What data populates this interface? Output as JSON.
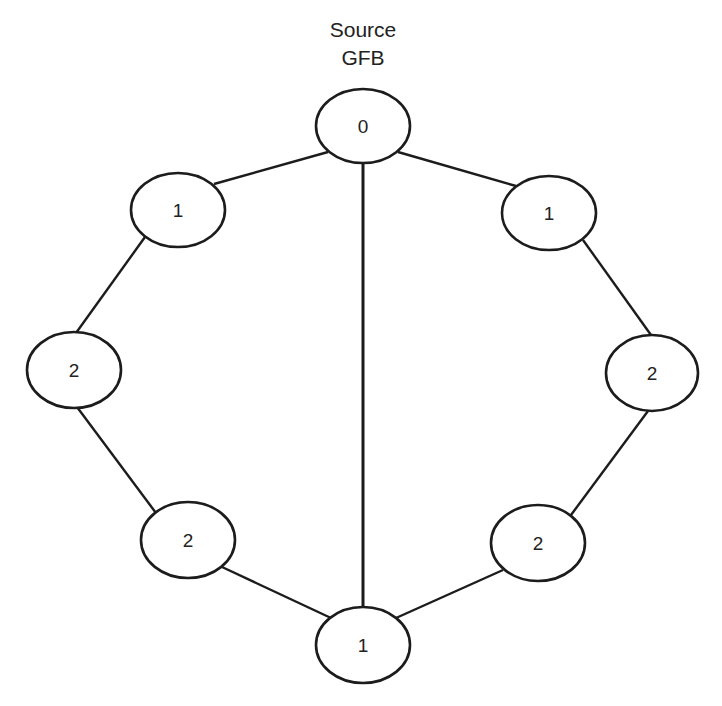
{
  "title": {
    "line1": "Source",
    "line2": "GFB"
  },
  "colors": {
    "stroke": "#1c1c1c",
    "fill": "#ffffff",
    "text": "#222222"
  },
  "nodes": [
    {
      "id": "top",
      "label": "0",
      "cx": 363,
      "cy": 126,
      "rx": 47,
      "ry": 37
    },
    {
      "id": "left-upper",
      "label": "1",
      "cx": 178,
      "cy": 210,
      "rx": 47,
      "ry": 37
    },
    {
      "id": "right-upper",
      "label": "1",
      "cx": 549,
      "cy": 213,
      "rx": 47,
      "ry": 37
    },
    {
      "id": "left-mid",
      "label": "2",
      "cx": 74,
      "cy": 370,
      "rx": 47,
      "ry": 38
    },
    {
      "id": "right-mid",
      "label": "2",
      "cx": 652,
      "cy": 373,
      "rx": 46,
      "ry": 38
    },
    {
      "id": "left-lower",
      "label": "2",
      "cx": 188,
      "cy": 540,
      "rx": 47,
      "ry": 38
    },
    {
      "id": "right-lower",
      "label": "2",
      "cx": 538,
      "cy": 543,
      "rx": 47,
      "ry": 38
    },
    {
      "id": "bottom",
      "label": "1",
      "cx": 363,
      "cy": 645,
      "rx": 47,
      "ry": 38
    }
  ],
  "edges": [
    {
      "from": "top",
      "to": "left-upper",
      "x1": 328,
      "y1": 152,
      "x2": 214,
      "y2": 184
    },
    {
      "from": "top",
      "to": "right-upper",
      "x1": 398,
      "y1": 152,
      "x2": 516,
      "y2": 186
    },
    {
      "from": "top",
      "to": "bottom",
      "x1": 363,
      "y1": 163,
      "x2": 363,
      "y2": 607,
      "width": 3
    },
    {
      "from": "left-upper",
      "to": "left-mid",
      "x1": 145,
      "y1": 237,
      "x2": 76,
      "y2": 333
    },
    {
      "from": "right-upper",
      "to": "right-mid",
      "x1": 583,
      "y1": 240,
      "x2": 651,
      "y2": 335
    },
    {
      "from": "left-mid",
      "to": "left-lower",
      "x1": 77,
      "y1": 407,
      "x2": 156,
      "y2": 513
    },
    {
      "from": "right-mid",
      "to": "right-lower",
      "x1": 648,
      "y1": 411,
      "x2": 571,
      "y2": 515
    },
    {
      "from": "left-lower",
      "to": "bottom",
      "x1": 222,
      "y1": 567,
      "x2": 331,
      "y2": 618
    },
    {
      "from": "right-lower",
      "to": "bottom",
      "x1": 503,
      "y1": 570,
      "x2": 396,
      "y2": 618
    }
  ]
}
